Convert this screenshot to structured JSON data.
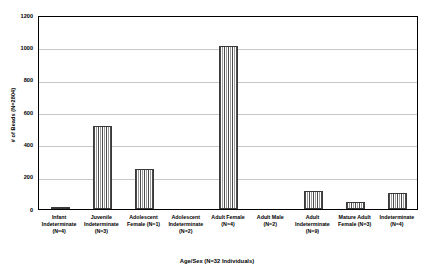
{
  "chart_data": {
    "type": "bar",
    "title": "",
    "subtitle": "",
    "xlabel": "Age/Sex (N=32 Individuals)",
    "ylabel": "# of Beads (N=2804)",
    "ylim": [
      0,
      1200
    ],
    "yticks": [
      0,
      200,
      400,
      600,
      800,
      1000,
      1200
    ],
    "ytick_labels": [
      "0",
      "200",
      "400",
      "600",
      "800",
      "1000",
      "1200"
    ],
    "grid": true,
    "legend": "none",
    "categories": [
      "Infant Indeterminate (N=4)",
      "Juvenile Indeterminate (N=3)",
      "Adolescent Female (N=1)",
      "Adolescent Indeterminate (N=2)",
      "Adult Female (N=4)",
      "Adult Male (N=2)",
      "Adult Indeterminate (N=9)",
      "Mature Adult Female (N=3)",
      "Indeterminate (N=4)"
    ],
    "category_lines": [
      [
        "Infant",
        "Indeterminate",
        "(N=4)"
      ],
      [
        "Juvenile",
        "Indeterminate",
        "(N=3)"
      ],
      [
        "Adolescent",
        "Female (N=1)"
      ],
      [
        "Adolescent",
        "Indeterminate",
        "(N=2)"
      ],
      [
        "Adult Female",
        "(N=4)"
      ],
      [
        "Adult Male",
        "(N=2)"
      ],
      [
        "Adult",
        "Indeterminate",
        "(N=9)"
      ],
      [
        "Mature Adult",
        "Female (N=3)"
      ],
      [
        "Indeterminate",
        "(N=4)"
      ]
    ],
    "values": [
      10,
      515,
      250,
      0,
      1010,
      0,
      110,
      45,
      100
    ],
    "bar_pattern": "vertical-pinstripe-hatch",
    "bar_edge_color": "#3a3a3a",
    "grid_color": "#c8c8c8",
    "frame_color": "#000000",
    "background_color": "#ffffff"
  }
}
